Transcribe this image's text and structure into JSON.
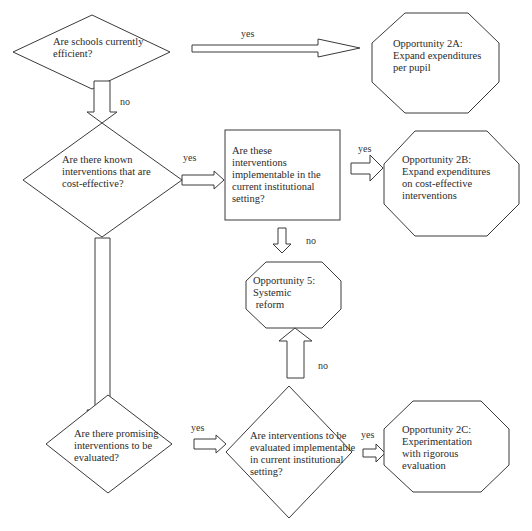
{
  "diagram": {
    "nodes": {
      "q_efficient": {
        "shape": "diamond",
        "text": "Are schools currently\nefficient?"
      },
      "q_known": {
        "shape": "diamond",
        "text": "Are there known\ninterventions that are\ncost-effective?"
      },
      "q_implementable": {
        "shape": "rectangle",
        "text": "Are these\ninterventions\nimplementable in the\ncurrent institutional\nsetting?"
      },
      "q_promising": {
        "shape": "diamond",
        "text": "Are there promising\ninterventions to be\nevaluated?"
      },
      "q_eval_implementable": {
        "shape": "diamond",
        "text": "Are interventions to be\nevaluated implementable\nin current institutional\nsetting?"
      },
      "opp_2a": {
        "shape": "octagon",
        "text": "Opportunity 2A:\nExpand expenditures\nper pupil"
      },
      "opp_2b": {
        "shape": "octagon",
        "text": "Opportunity 2B:\nExpand expenditures\non cost-effective\ninterventions"
      },
      "opp_5": {
        "shape": "octagon",
        "text": "Opportunity 5:\nSystemic\n reform"
      },
      "opp_2c": {
        "shape": "octagon",
        "text": "Opportunity 2C:\nExperimentation\nwith rigorous\nevaluation"
      }
    },
    "edges": {
      "efficient_yes": {
        "from": "q_efficient",
        "to": "opp_2a",
        "label": "yes"
      },
      "efficient_no": {
        "from": "q_efficient",
        "to": "q_known",
        "label": "no"
      },
      "known_yes": {
        "from": "q_known",
        "to": "q_implementable",
        "label": "yes"
      },
      "known_no": {
        "from": "q_known",
        "to": "q_promising",
        "label": ""
      },
      "implementable_yes": {
        "from": "q_implementable",
        "to": "opp_2b",
        "label": "yes"
      },
      "implementable_no": {
        "from": "q_implementable",
        "to": "opp_5",
        "label": "no"
      },
      "promising_yes": {
        "from": "q_promising",
        "to": "q_eval_implementable",
        "label": "yes"
      },
      "eval_yes": {
        "from": "q_eval_implementable",
        "to": "opp_2c",
        "label": "yes"
      },
      "eval_no": {
        "from": "q_eval_implementable",
        "to": "opp_5",
        "label": "no"
      }
    },
    "colors": {
      "stroke": "#3a3a3a",
      "fill": "#ffffff",
      "text": "#2a2a2a"
    }
  }
}
